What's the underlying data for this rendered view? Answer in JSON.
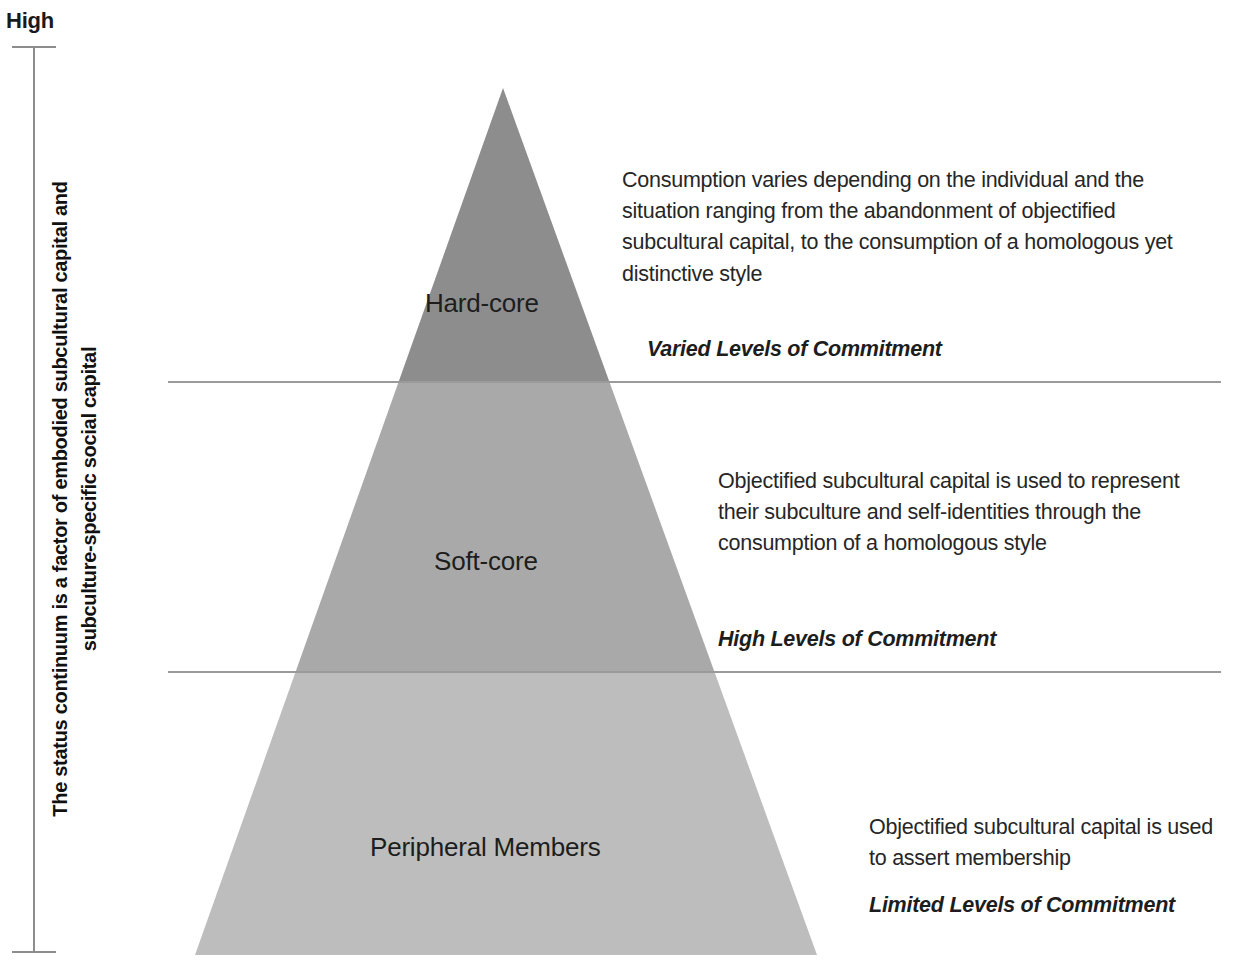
{
  "axis": {
    "top_label": "High",
    "description_line1": "The status continuum is a factor of embodied subcultural capital and",
    "description_line2": "subculture-specific social capital"
  },
  "pyramid": {
    "apex": {
      "x": 503,
      "y": 88
    },
    "base": {
      "left_x": 195,
      "right_x": 817,
      "y": 955
    },
    "tiers": [
      {
        "label": "Hard-core",
        "fill": "#8d8d8d",
        "top_y": 88,
        "bottom_y": 381
      },
      {
        "label": "Soft-core",
        "fill": "#a9a9a9",
        "top_y": 381,
        "bottom_y": 671
      },
      {
        "label": "Peripheral Members",
        "fill": "#bdbdbd",
        "top_y": 671,
        "bottom_y": 955
      }
    ]
  },
  "dividers": [
    {
      "y": 381
    },
    {
      "y": 671
    }
  ],
  "notes": [
    {
      "body": "Consumption varies depending on the individual and the situation ranging from the abandonment of objectified subcultural capital, to the consumption of a homologous yet distinctive style",
      "commitment": "Varied Levels of Commitment"
    },
    {
      "body": "Objectified subcultural capital is used to represent their subculture and self-identities through the consumption of a homologous style",
      "commitment": "High Levels of Commitment"
    },
    {
      "body": "Objectified subcultural capital is used to assert membership",
      "commitment": "Limited Levels of Commitment"
    }
  ],
  "colors": {
    "background": "#ffffff",
    "axis_line": "#8d8d8d",
    "divider_line": "#9a9a9a",
    "text": "#262626"
  }
}
